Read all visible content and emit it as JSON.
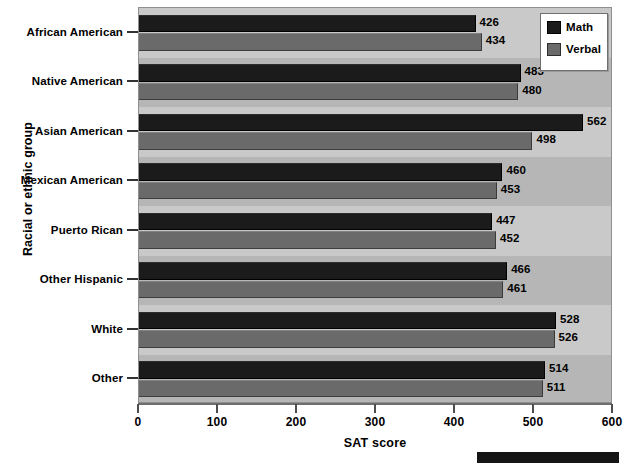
{
  "chart_data": {
    "type": "bar",
    "orientation": "horizontal",
    "title": "",
    "xlabel": "SAT score",
    "ylabel": "Racial or ethnic group",
    "xlim": [
      0,
      600
    ],
    "xticks": [
      0,
      100,
      200,
      300,
      400,
      500,
      600
    ],
    "xtick_labels": [
      "0",
      "100",
      "200",
      "300",
      "400",
      "500",
      "600"
    ],
    "grid": false,
    "legend_position": "top-right",
    "categories": [
      "African American",
      "Native American",
      "Asian American",
      "Mexican American",
      "Puerto Rican",
      "Other Hispanic",
      "White",
      "Other"
    ],
    "series": [
      {
        "name": "Math",
        "color": "#1b1b1b",
        "values": [
          426,
          483,
          562,
          460,
          447,
          466,
          528,
          514
        ]
      },
      {
        "name": "Verbal",
        "color": "#6a6a6a",
        "values": [
          434,
          480,
          498,
          453,
          452,
          461,
          526,
          511
        ]
      }
    ],
    "data_labels": [
      {
        "category": "African American",
        "math": "426",
        "verbal": "434"
      },
      {
        "category": "Native American",
        "math": "483",
        "verbal": "480"
      },
      {
        "category": "Asian American",
        "math": "562",
        "verbal": "498"
      },
      {
        "category": "Mexican American",
        "math": "460",
        "verbal": "453"
      },
      {
        "category": "Puerto Rican",
        "math": "447",
        "verbal": "452"
      },
      {
        "category": "Other Hispanic",
        "math": "466",
        "verbal": "461"
      },
      {
        "category": "White",
        "math": "528",
        "verbal": "526"
      },
      {
        "category": "Other",
        "math": "514",
        "verbal": "511"
      }
    ]
  },
  "legend": {
    "entries": [
      {
        "label": "Math",
        "swatch": "math"
      },
      {
        "label": "Verbal",
        "swatch": "verbal"
      }
    ]
  },
  "colors": {
    "math": "#1b1b1b",
    "verbal": "#6a6a6a",
    "plot_background": "#b6b6b6",
    "band_light": "#c9c9c9",
    "axis": "#6e6e6e",
    "text": "#000000"
  }
}
